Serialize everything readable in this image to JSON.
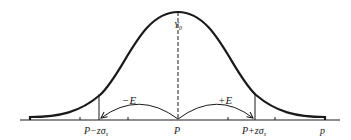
{
  "diagram": {
    "type": "normal-distribution-curve",
    "peak_label": "Y",
    "peak_label_sub": "0",
    "axis_variable": "p",
    "center_label": "P",
    "left_bound_label": "P−zσ",
    "left_bound_sub": "s",
    "right_bound_label": "P+zσ",
    "right_bound_sub": "s",
    "left_error_label": "−E",
    "right_error_label": "+E",
    "colors": {
      "line": "#1a1a1a",
      "background": "#ffffff"
    }
  }
}
